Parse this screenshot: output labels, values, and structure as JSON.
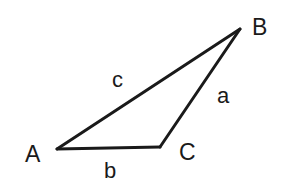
{
  "diagram": {
    "type": "triangle",
    "vertices": [
      {
        "id": "A",
        "label": "A",
        "x": 57,
        "y": 149
      },
      {
        "id": "B",
        "label": "B",
        "x": 240,
        "y": 29
      },
      {
        "id": "C",
        "label": "C",
        "x": 160,
        "y": 147
      }
    ],
    "sides": [
      {
        "id": "a",
        "label": "a",
        "from": "B",
        "to": "C"
      },
      {
        "id": "b",
        "label": "b",
        "from": "A",
        "to": "C"
      },
      {
        "id": "c",
        "label": "c",
        "from": "A",
        "to": "B"
      }
    ],
    "line_color": "#1a1a1a",
    "background": "#ffffff"
  }
}
